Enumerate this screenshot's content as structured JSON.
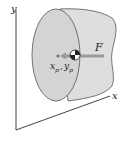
{
  "diagram": {
    "axes": {
      "x_label": "x",
      "y_label": "y"
    },
    "force_label": "F",
    "point_label": "x",
    "point_sub": "p",
    "point_label2": "y",
    "point_sub2": "p",
    "separator": ",",
    "colors": {
      "body_front": "#d2d2d2",
      "body_back": "#dcdcdc",
      "outline": "#555555",
      "arrow": "#9a9a9a"
    }
  }
}
